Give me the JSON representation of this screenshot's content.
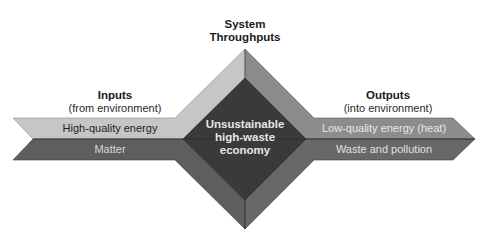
{
  "title": {
    "line1": "System",
    "line2": "Throughputs"
  },
  "inputs": {
    "heading": "Inputs",
    "subheading": "(from environment)",
    "bands": [
      {
        "label": "High-quality energy",
        "color": "#c6c6c6",
        "text_color": "#1e1e1e"
      },
      {
        "label": "Matter",
        "color": "#5e5e5e",
        "text_color": "#d8d8d8"
      }
    ]
  },
  "center": {
    "lines": [
      "Unsustainable",
      "high-waste",
      "economy"
    ],
    "color": "#3a3a3a",
    "text_color": "#e6e6e6"
  },
  "outputs": {
    "heading": "Outputs",
    "subheading": "(into environment)",
    "bands": [
      {
        "label": "Low-quality energy (heat)",
        "color": "#8c8c8c",
        "text_color": "#e8e8e8"
      },
      {
        "label": "Waste and pollution",
        "color": "#666666",
        "text_color": "#e0e0e0"
      }
    ]
  },
  "colors": {
    "facet_upper_left": "#c6c6c6",
    "facet_upper_right": "#8c8c8c",
    "facet_lower_left": "#5e5e5e",
    "facet_lower_right": "#686868",
    "inner_diamond": "#3a3a3a"
  }
}
